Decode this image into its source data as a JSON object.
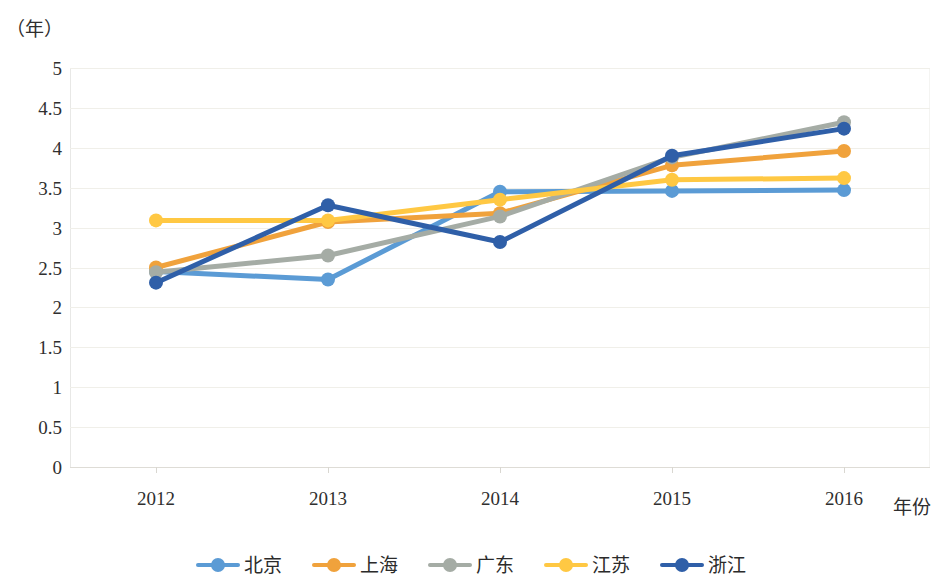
{
  "chart_data": {
    "type": "line",
    "title": "",
    "subtitle": "",
    "xlabel": "年份",
    "ylabel": "（年）",
    "y_unit_caption": "（年）",
    "categories": [
      "2012",
      "2013",
      "2014",
      "2015",
      "2016"
    ],
    "x": [
      2012,
      2013,
      2014,
      2015,
      2016
    ],
    "ylim": [
      0,
      5
    ],
    "y_ticks": [
      "5",
      "4.5",
      "4",
      "3.5",
      "3",
      "2.5",
      "2",
      "1.5",
      "1",
      "0.5",
      "0"
    ],
    "y_tick_values": [
      5,
      4.5,
      4,
      3.5,
      3,
      2.5,
      2,
      1.5,
      1,
      0.5,
      0
    ],
    "grid": true,
    "grid_axis": "y",
    "legend_position": "bottom",
    "markers": true,
    "series": [
      {
        "name": "北京",
        "color": "#5B9BD5",
        "values": [
          2.45,
          2.35,
          3.45,
          3.46,
          3.47
        ]
      },
      {
        "name": "上海",
        "color": "#F0A23C",
        "values": [
          2.5,
          3.07,
          3.18,
          3.78,
          3.96
        ]
      },
      {
        "name": "广东",
        "color": "#A5ACA5",
        "values": [
          2.44,
          2.65,
          3.14,
          3.88,
          4.32
        ]
      },
      {
        "name": "江苏",
        "color": "#FFC843",
        "values": [
          3.09,
          3.09,
          3.35,
          3.6,
          3.62
        ]
      },
      {
        "name": "浙江",
        "color": "#2F5FA8",
        "values": [
          2.31,
          3.28,
          2.82,
          3.9,
          4.24
        ]
      }
    ]
  },
  "axes": {
    "y_unit": "（年）",
    "x_title": "年份"
  },
  "legend": {
    "items": [
      {
        "label": "北京",
        "color": "#5B9BD5"
      },
      {
        "label": "上海",
        "color": "#F0A23C"
      },
      {
        "label": "广东",
        "color": "#A5ACA5"
      },
      {
        "label": "江苏",
        "color": "#FFC843"
      },
      {
        "label": "浙江",
        "color": "#2F5FA8"
      }
    ]
  }
}
